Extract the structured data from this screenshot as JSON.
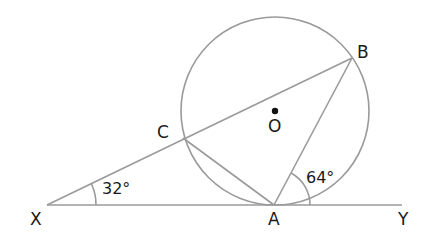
{
  "diagram": {
    "type": "circle-geometry",
    "points": {
      "X": {
        "label": "X"
      },
      "A": {
        "label": "A"
      },
      "Y": {
        "label": "Y"
      },
      "B": {
        "label": "B"
      },
      "C": {
        "label": "C"
      },
      "O": {
        "label": "O"
      }
    },
    "angles": {
      "at_X": "32°",
      "at_A": "64°"
    },
    "colors": {
      "lines": "#9a9a9a",
      "text": "#1a1a1a",
      "background": "#ffffff"
    }
  }
}
